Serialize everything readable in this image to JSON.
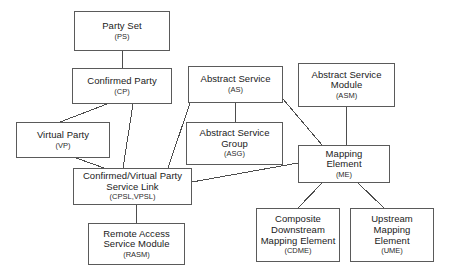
{
  "diagram": {
    "background_color": "#ffffff",
    "line_color": "#4d4d4d",
    "box_border_color": "#5a5a5a",
    "text_color": "#1a1a1a",
    "nodes": [
      {
        "id": "ps",
        "title": "Party Set",
        "abbr": "(PS)",
        "x": 74,
        "y": 11,
        "w": 96,
        "h": 40
      },
      {
        "id": "cp",
        "title": "Confirmed Party",
        "abbr": "(CP)",
        "x": 72,
        "y": 68,
        "w": 100,
        "h": 36
      },
      {
        "id": "as",
        "title": "Abstract Service",
        "abbr": "(AS)",
        "x": 188,
        "y": 66,
        "w": 95,
        "h": 37
      },
      {
        "id": "asm",
        "title": "Abstract Service\nModule",
        "abbr": "(ASM)",
        "x": 298,
        "y": 63,
        "w": 97,
        "h": 44
      },
      {
        "id": "asg",
        "title": "Abstract Service\nGroup",
        "abbr": "(ASG)",
        "x": 186,
        "y": 122,
        "w": 97,
        "h": 43
      },
      {
        "id": "vp",
        "title": "Virtual Party",
        "abbr": "(VP)",
        "x": 16,
        "y": 122,
        "w": 94,
        "h": 36
      },
      {
        "id": "cpsl",
        "title": "Confirmed/Virtual Party\nService Link",
        "abbr": "(CPSL,VPSL)",
        "x": 73,
        "y": 168,
        "w": 119,
        "h": 37
      },
      {
        "id": "me",
        "title": "Mapping\nElement",
        "abbr": "(ME)",
        "x": 298,
        "y": 145,
        "w": 92,
        "h": 38
      },
      {
        "id": "rasm",
        "title": "Remote Access\nService Module",
        "abbr": "(RASM)",
        "x": 88,
        "y": 223,
        "w": 97,
        "h": 42
      },
      {
        "id": "cdme",
        "title": "Composite\nDownstream\nMapping Element",
        "abbr": "(CDME)",
        "x": 256,
        "y": 208,
        "w": 84,
        "h": 54
      },
      {
        "id": "ume",
        "title": "Upstream\nMapping\nElement",
        "abbr": "(UME)",
        "x": 350,
        "y": 208,
        "w": 84,
        "h": 54
      }
    ],
    "edges": [
      {
        "id": "ps-cp",
        "from": "ps",
        "to": "cp",
        "x1": 122,
        "y1": 51,
        "x2": 122,
        "y2": 68
      },
      {
        "id": "cp-vp",
        "from": "cp",
        "to": "vp",
        "x1": 107,
        "y1": 104,
        "x2": 60,
        "y2": 122
      },
      {
        "id": "cp-cpsl",
        "from": "cp",
        "to": "cpsl",
        "x1": 133,
        "y1": 104,
        "x2": 123,
        "y2": 168
      },
      {
        "id": "vp-cpsl",
        "from": "vp",
        "to": "cpsl",
        "x1": 76,
        "y1": 158,
        "x2": 104,
        "y2": 168
      },
      {
        "id": "as-asg",
        "from": "as",
        "to": "asg",
        "x1": 235,
        "y1": 103,
        "x2": 235,
        "y2": 122
      },
      {
        "id": "as-cpsl",
        "from": "as",
        "to": "cpsl",
        "x1": 190,
        "y1": 103,
        "x2": 168,
        "y2": 168
      },
      {
        "id": "as-me",
        "from": "as",
        "to": "me",
        "x1": 283,
        "y1": 99,
        "x2": 322,
        "y2": 145
      },
      {
        "id": "asm-me",
        "from": "asm",
        "to": "me",
        "x1": 346,
        "y1": 107,
        "x2": 346,
        "y2": 145
      },
      {
        "id": "cpsl-me",
        "from": "cpsl",
        "to": "me",
        "x1": 192,
        "y1": 182,
        "x2": 298,
        "y2": 163
      },
      {
        "id": "cpsl-rasm",
        "from": "cpsl",
        "to": "rasm",
        "x1": 136,
        "y1": 205,
        "x2": 136,
        "y2": 223
      },
      {
        "id": "me-cdme",
        "from": "me",
        "to": "cdme",
        "x1": 322,
        "y1": 183,
        "x2": 298,
        "y2": 208
      },
      {
        "id": "me-ume",
        "from": "me",
        "to": "ume",
        "x1": 358,
        "y1": 183,
        "x2": 384,
        "y2": 208
      }
    ]
  }
}
